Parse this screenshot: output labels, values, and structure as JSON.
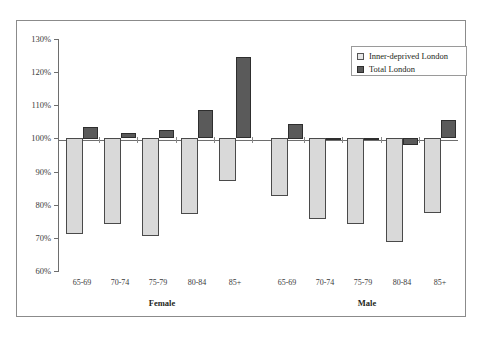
{
  "chart_data": {
    "type": "bar",
    "title": "",
    "subtitle": "",
    "xlabel": "",
    "ylabel": "",
    "ylim": [
      60,
      130
    ],
    "ytick_labels": [
      "130%",
      "120%",
      "110%",
      "100%",
      "90%",
      "80%",
      "70%",
      "60%"
    ],
    "ytick_values": [
      130,
      120,
      110,
      100,
      90,
      80,
      70,
      60
    ],
    "grid": false,
    "baseline": 100,
    "legend_position": "top-right",
    "categories": [
      "65-69",
      "70-74",
      "75-79",
      "80-84",
      "85+",
      "65-69",
      "70-74",
      "75-79",
      "80-84",
      "85+"
    ],
    "group_labels": [
      "Female",
      "Male"
    ],
    "groups": [
      {
        "name": "Female",
        "categories": [
          "65-69",
          "70-74",
          "75-79",
          "80-84",
          "85+"
        ]
      },
      {
        "name": "Male",
        "categories": [
          "65-69",
          "70-74",
          "75-79",
          "80-84",
          "85+"
        ]
      }
    ],
    "series": [
      {
        "name": "Inner-deprived London",
        "color": "#d9d9d9",
        "values": [
          71,
          74,
          70.5,
          77,
          87,
          82.5,
          75.5,
          74,
          68.5,
          77.5
        ]
      },
      {
        "name": "Total London",
        "color": "#5a5a5a",
        "values": [
          103.5,
          101.5,
          102.5,
          108.5,
          124.5,
          104.5,
          100,
          100,
          98,
          105.5
        ]
      }
    ]
  },
  "legend": {
    "items": [
      {
        "label": "Inner-deprived London",
        "swatch": "light"
      },
      {
        "label": "Total London",
        "swatch": "dark"
      }
    ]
  },
  "axis": {
    "y_labels": [
      "130%",
      "120%",
      "110%",
      "100%",
      "90%",
      "80%",
      "70%",
      "60%"
    ]
  },
  "x_labels": [
    "65-69",
    "70-74",
    "75-79",
    "80-84",
    "85+",
    "65-69",
    "70-74",
    "75-79",
    "80-84",
    "85+"
  ],
  "group_labels": [
    "Female",
    "Male"
  ]
}
